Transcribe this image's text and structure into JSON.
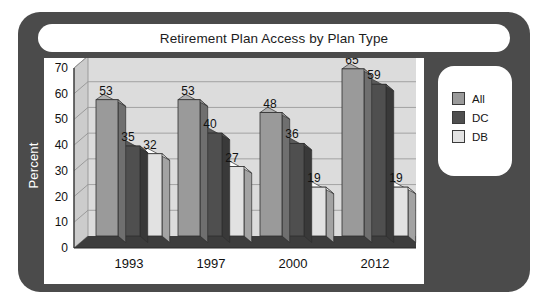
{
  "frame": {
    "accent_dark": "#4b4b4b",
    "panel_bg": "#ffffff"
  },
  "title": {
    "text": "Retirement Plan Access by Plan Type"
  },
  "axis": {
    "ylabel": "Percent"
  },
  "legend": {
    "items": [
      {
        "label": "All",
        "color": "#9a9a9a"
      },
      {
        "label": "DC",
        "color": "#4f4f4f"
      },
      {
        "label": "DB",
        "color": "#e2e2e2"
      }
    ]
  },
  "chart_data": {
    "type": "bar",
    "title": "Retirement Plan Access by Plan Type",
    "xlabel": "",
    "ylabel": "Percent",
    "categories": [
      "1993",
      "1997",
      "2000",
      "2012"
    ],
    "yticks": [
      0,
      10,
      20,
      30,
      40,
      50,
      60,
      70
    ],
    "ylim": [
      0,
      70
    ],
    "grid": true,
    "legend_position": "right",
    "series": [
      {
        "name": "All",
        "color": "#9a9a9a",
        "values": [
          53,
          53,
          48,
          65
        ]
      },
      {
        "name": "DC",
        "color": "#4f4f4f",
        "values": [
          35,
          40,
          36,
          59
        ]
      },
      {
        "name": "DB",
        "color": "#e2e2e2",
        "values": [
          32,
          27,
          19,
          19
        ]
      }
    ],
    "data_labels": [
      {
        "category": "1993",
        "series": "All",
        "value": 53
      },
      {
        "category": "1993",
        "series": "DC",
        "value": 35
      },
      {
        "category": "1993",
        "series": "DB",
        "value": 32
      },
      {
        "category": "1997",
        "series": "All",
        "value": 53
      },
      {
        "category": "1997",
        "series": "DC",
        "value": 40
      },
      {
        "category": "1997",
        "series": "DB",
        "value": 27
      },
      {
        "category": "2000",
        "series": "All",
        "value": 48
      },
      {
        "category": "2000",
        "series": "DC",
        "value": 36
      },
      {
        "category": "2000",
        "series": "DB",
        "value": 19
      },
      {
        "category": "2012",
        "series": "All",
        "value": 65
      },
      {
        "category": "2012",
        "series": "DC",
        "value": 59
      },
      {
        "category": "2012",
        "series": "DB",
        "value": 19
      }
    ]
  }
}
